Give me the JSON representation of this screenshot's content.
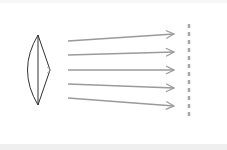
{
  "diagram": {
    "type": "optics",
    "colors": {
      "background": "#ffffff",
      "lens_stroke": "#333333",
      "ray": "#9a9a9a",
      "plane": "#a8a8a8",
      "bottom_strip": "#efefef"
    },
    "lens": {
      "top": [
        38,
        35
      ],
      "bottom": [
        38,
        105
      ],
      "left_bulge_x": 27,
      "tip": [
        50,
        70
      ]
    },
    "rays": [
      {
        "x1": 68,
        "y1": 41,
        "x2": 174,
        "y2": 34
      },
      {
        "x1": 68,
        "y1": 55,
        "x2": 174,
        "y2": 52
      },
      {
        "x1": 68,
        "y1": 70,
        "x2": 174,
        "y2": 70
      },
      {
        "x1": 68,
        "y1": 84,
        "x2": 174,
        "y2": 88
      },
      {
        "x1": 68,
        "y1": 98,
        "x2": 174,
        "y2": 106
      }
    ],
    "plane": {
      "x": 189,
      "y1": 24,
      "y2": 118,
      "dash": "4 4"
    }
  }
}
